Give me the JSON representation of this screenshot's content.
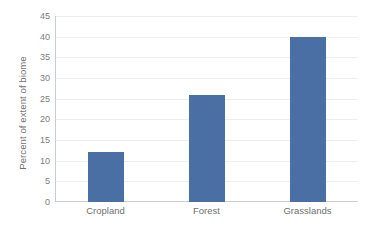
{
  "chart_data": {
    "type": "bar",
    "title": "",
    "xlabel": "",
    "ylabel": "Percent of extent of biome",
    "categories": [
      "Cropland",
      "Forest",
      "Grasslands"
    ],
    "values": [
      12,
      26,
      40
    ],
    "ylim": [
      0,
      45
    ],
    "yticks": [
      0,
      5,
      10,
      15,
      20,
      25,
      30,
      35,
      40,
      45
    ],
    "ytick_labels": [
      "0",
      "5",
      "10",
      "15",
      "20",
      "25",
      "30",
      "35",
      "40",
      "45"
    ],
    "grid": true,
    "legend": false,
    "bar_color": "#4a6fa5",
    "gridline_color": "#eceef2",
    "axis_color": "#c8ccd4",
    "label_color": "#6f6f6f",
    "background": "#ffffff"
  }
}
